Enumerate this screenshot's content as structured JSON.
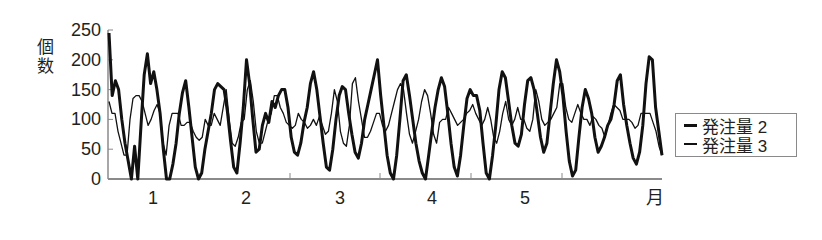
{
  "chart_data": {
    "type": "line",
    "title": "",
    "xlabel": "月",
    "ylabel": "個数",
    "ylim": [
      0,
      250
    ],
    "yticks": [
      0,
      50,
      100,
      150,
      200,
      250
    ],
    "xtick_labels": [
      "1",
      "2",
      "3",
      "4",
      "5"
    ],
    "grid": false,
    "legend_position": "right",
    "series": [
      {
        "name": "発注量 2",
        "style": "thick",
        "color": "#111111",
        "values": [
          245,
          140,
          165,
          150,
          100,
          60,
          30,
          0,
          55,
          0,
          90,
          175,
          210,
          160,
          180,
          150,
          110,
          50,
          0,
          0,
          25,
          60,
          110,
          145,
          165,
          120,
          70,
          20,
          0,
          10,
          50,
          80,
          110,
          150,
          160,
          155,
          150,
          115,
          65,
          20,
          10,
          60,
          120,
          200,
          160,
          100,
          45,
          50,
          90,
          110,
          95,
          130,
          120,
          140,
          150,
          150,
          120,
          70,
          45,
          40,
          60,
          95,
          120,
          160,
          180,
          150,
          105,
          60,
          20,
          15,
          50,
          100,
          140,
          155,
          150,
          110,
          75,
          45,
          35,
          60,
          100,
          125,
          150,
          175,
          200,
          140,
          90,
          40,
          10,
          0,
          40,
          100,
          165,
          175,
          140,
          100,
          60,
          30,
          10,
          0,
          40,
          80,
          120,
          150,
          170,
          155,
          110,
          60,
          20,
          5,
          40,
          90,
          135,
          150,
          140,
          140,
          115,
          60,
          10,
          0,
          40,
          90,
          150,
          180,
          170,
          130,
          90,
          60,
          55,
          75,
          125,
          165,
          170,
          150,
          110,
          70,
          45,
          60,
          110,
          160,
          200,
          180,
          140,
          80,
          30,
          5,
          15,
          70,
          120,
          150,
          135,
          110,
          70,
          45,
          55,
          70,
          90,
          100,
          125,
          165,
          175,
          125,
          90,
          60,
          35,
          25,
          45,
          90,
          160,
          205,
          200,
          120,
          80,
          40
        ]
      },
      {
        "name": "発注量 3",
        "style": "thin",
        "color": "#111111",
        "values": [
          130,
          110,
          110,
          80,
          60,
          40,
          40,
          100,
          135,
          140,
          140,
          130,
          110,
          90,
          100,
          115,
          125,
          110,
          60,
          40,
          90,
          110,
          110,
          110,
          90,
          90,
          95,
          95,
          80,
          70,
          65,
          70,
          100,
          90,
          90,
          110,
          100,
          90,
          120,
          150,
          100,
          60,
          55,
          70,
          95,
          100,
          150,
          165,
          130,
          80,
          60,
          60,
          80,
          100,
          110,
          140,
          140,
          120,
          110,
          95,
          90,
          85,
          90,
          110,
          100,
          95,
          85,
          90,
          100,
          90,
          105,
          90,
          75,
          80,
          110,
          150,
          130,
          80,
          60,
          55,
          90,
          160,
          170,
          130,
          100,
          70,
          70,
          80,
          95,
          110,
          110,
          90,
          80,
          90,
          110,
          130,
          150,
          160,
          150,
          110,
          75,
          60,
          80,
          100,
          130,
          150,
          140,
          110,
          75,
          60,
          95,
          100,
          100,
          120,
          110,
          100,
          90,
          95,
          100,
          110,
          115,
          125,
          110,
          100,
          90,
          100,
          120,
          100,
          70,
          60,
          80,
          110,
          130,
          100,
          90,
          100,
          120,
          100,
          100,
          85,
          80,
          100,
          150,
          130,
          100,
          90,
          95,
          100,
          110,
          120,
          160,
          160,
          120,
          100,
          95,
          110,
          125,
          110,
          100,
          100,
          90,
          105,
          100,
          90,
          85,
          70,
          90,
          110,
          125,
          120,
          115,
          100,
          100,
          100,
          95,
          85,
          90,
          110,
          110,
          110,
          110,
          95,
          80,
          55,
          40
        ]
      }
    ]
  },
  "axis": {
    "ylabel_lines": [
      "個",
      "数"
    ],
    "x_unit": "月"
  },
  "legend": {
    "items": [
      "発注量 2",
      "発注量 3"
    ]
  }
}
